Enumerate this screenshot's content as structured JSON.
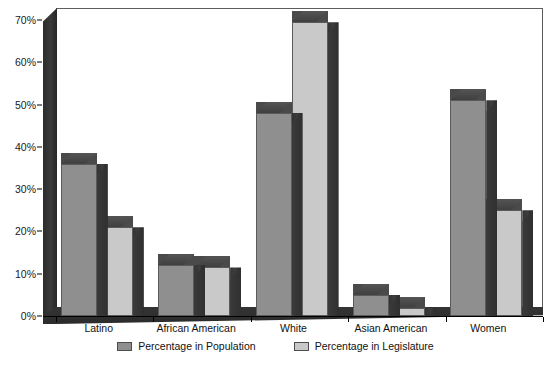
{
  "chart_data": {
    "type": "bar",
    "title": "",
    "subtitle": "",
    "xlabel": "",
    "ylabel": "",
    "categories": [
      "Latino",
      "African American",
      "White",
      "Asian American",
      "Women"
    ],
    "series": [
      {
        "name": "Percentage in Population",
        "color": "#8f8f8f",
        "values": [
          36,
          12,
          48,
          5,
          51
        ]
      },
      {
        "name": "Percentage in Legislature",
        "color": "#c9c9c9",
        "values": [
          21,
          11.5,
          69.5,
          2,
          25
        ]
      }
    ],
    "ylim": [
      0,
      70
    ],
    "ytick_values": [
      0,
      10,
      20,
      30,
      40,
      50,
      60,
      70
    ],
    "ytick_labels": [
      "0%",
      "10%",
      "20%",
      "30%",
      "40%",
      "50%",
      "60%",
      "70%"
    ],
    "grid": false,
    "legend_position": "bottom",
    "style": "3d-columns",
    "colors": {
      "series_population": "#8f8f8f",
      "series_legislature": "#c9c9c9",
      "wall_dark": "#303030",
      "plot_background": "#ffffff",
      "axis_line": "#000000",
      "text": "#111111"
    }
  }
}
